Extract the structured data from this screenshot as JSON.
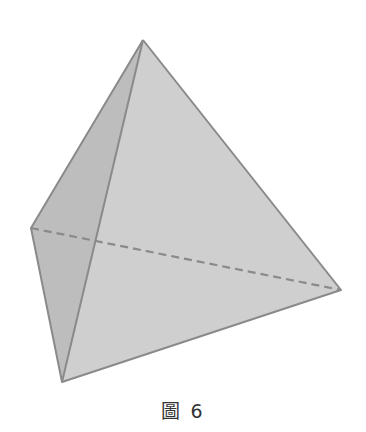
{
  "figure": {
    "type": "tetrahedron",
    "caption": "圖 6",
    "vertices": {
      "apex": [
        143,
        40
      ],
      "left": [
        31,
        228
      ],
      "bottom": [
        62,
        382
      ],
      "right": [
        341,
        290
      ]
    },
    "colors": {
      "face_front": "#cfcfcf",
      "face_left": "#bdbdbd",
      "edge": "#8a8a8a",
      "hidden_edge": "#8a8a8a",
      "caption": "#333333"
    }
  }
}
